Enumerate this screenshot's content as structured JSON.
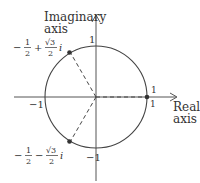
{
  "diagram": {
    "axes": {
      "imaginary_label_line1": "Imaginary",
      "imaginary_label_line2": "axis",
      "real_label_line1": "Real",
      "real_label_line2": "axis"
    },
    "ticks": {
      "top": "1",
      "bottom": "−1",
      "left": "−1",
      "right_upper": "1",
      "right_lower": "1"
    },
    "points": [
      {
        "name": "1",
        "angle_deg": 0
      },
      {
        "name": "upper",
        "angle_deg": 120,
        "label_part1": "−",
        "label_frac1_num": "1",
        "label_frac1_den": "2",
        "label_op": "+",
        "label_frac2_num": "√3",
        "label_frac2_den": "2",
        "label_i": "i"
      },
      {
        "name": "lower",
        "angle_deg": 240,
        "label_part1": "−",
        "label_frac1_num": "1",
        "label_frac1_den": "2",
        "label_op": "−",
        "label_frac2_num": "√3",
        "label_frac2_den": "2",
        "label_i": "i"
      }
    ],
    "colors": {
      "stroke": "#444444",
      "text": "#333333",
      "point": "#333333"
    }
  }
}
